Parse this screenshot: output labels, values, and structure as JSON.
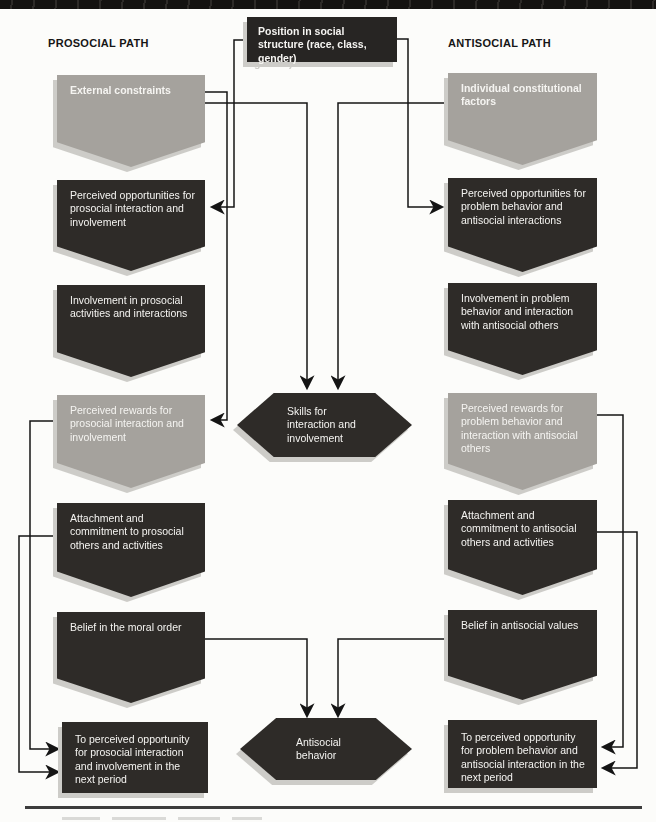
{
  "headers": {
    "prosocial": "PROSOCIAL PATH",
    "antisocial": "ANTISOCIAL PATH"
  },
  "root": {
    "label": "Position in social structure (race, class, gender)"
  },
  "center": {
    "skills": {
      "label": "Skills for interaction and involvement"
    },
    "antisocial_behavior": {
      "label": "Antisocial behavior"
    }
  },
  "prosocial_path": {
    "nodes": [
      {
        "label": "External constraints",
        "tone": "gray",
        "shape": "pentagon"
      },
      {
        "label": "Perceived opportunities for prosocial interaction and involvement",
        "tone": "dark",
        "shape": "pentagon"
      },
      {
        "label": "Involvement in prosocial activities and interactions",
        "tone": "dark",
        "shape": "pentagon"
      },
      {
        "label": "Perceived rewards for prosocial interaction and involvement",
        "tone": "gray",
        "shape": "pentagon"
      },
      {
        "label": "Attachment and commitment to prosocial others and activities",
        "tone": "dark",
        "shape": "pentagon"
      },
      {
        "label": "Belief in the moral order",
        "tone": "dark",
        "shape": "pentagon"
      },
      {
        "label": "To perceived opportunity for prosocial interaction and involvement in the next period",
        "tone": "dark",
        "shape": "rectangle"
      }
    ]
  },
  "antisocial_path": {
    "nodes": [
      {
        "label": "Individual constitutional factors",
        "tone": "gray",
        "shape": "pentagon"
      },
      {
        "label": "Perceived opportunities for problem behavior and antisocial interactions",
        "tone": "dark",
        "shape": "pentagon"
      },
      {
        "label": "Involvement in problem behavior and interaction with antisocial others",
        "tone": "dark",
        "shape": "pentagon"
      },
      {
        "label": "Perceived rewards for problem behavior and interaction with antisocial others",
        "tone": "gray",
        "shape": "pentagon"
      },
      {
        "label": "Attachment and commitment to antisocial others and activities",
        "tone": "dark",
        "shape": "pentagon"
      },
      {
        "label": "Belief in antisocial values",
        "tone": "dark",
        "shape": "pentagon"
      },
      {
        "label": "To perceived opportunity for problem behavior and antisocial interaction in the next period",
        "tone": "dark",
        "shape": "rectangle"
      }
    ]
  },
  "edges": [
    {
      "from": "Position in social structure (race, class, gender)",
      "to": "Perceived opportunities for prosocial interaction and involvement"
    },
    {
      "from": "Position in social structure (race, class, gender)",
      "to": "Perceived opportunities for problem behavior and antisocial interactions"
    },
    {
      "from": "External constraints",
      "to": "Perceived rewards for prosocial interaction and involvement"
    },
    {
      "from": "External constraints",
      "to": "Skills for interaction and involvement"
    },
    {
      "from": "Individual constitutional factors",
      "to": "Skills for interaction and involvement"
    },
    {
      "from": "Perceived rewards for prosocial interaction and involvement",
      "to": "To perceived opportunity for prosocial interaction and involvement in the next period"
    },
    {
      "from": "Attachment and commitment to prosocial others and activities",
      "to": "To perceived opportunity for prosocial interaction and involvement in the next period"
    },
    {
      "from": "Perceived rewards for problem behavior and interaction with antisocial others",
      "to": "To perceived opportunity for problem behavior and antisocial interaction in the next period"
    },
    {
      "from": "Attachment and commitment to antisocial others and activities",
      "to": "To perceived opportunity for problem behavior and antisocial interaction in the next period"
    },
    {
      "from": "Belief in the moral order",
      "to": "Antisocial behavior"
    },
    {
      "from": "Belief in antisocial values",
      "to": "Antisocial behavior"
    }
  ],
  "colors": {
    "dark_box": "#2e2b28",
    "gray_box": "#a5a29d",
    "title_box": "#272523",
    "shadow": "#cdccc8",
    "line": "#141414",
    "page_bg": "#fcfcfa",
    "text_light": "#f5f4f1",
    "rule": "#3c3c3c"
  }
}
